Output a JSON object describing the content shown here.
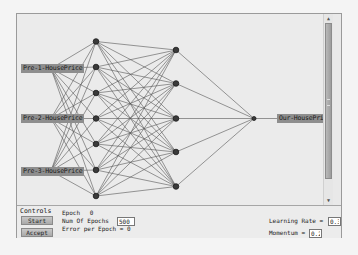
{
  "network": {
    "inputs": [
      {
        "label": "Pre-1-HousePrice",
        "y": 54.5
      },
      {
        "label": "Pre-2-HousePrice",
        "y": 104.5
      },
      {
        "label": "Pre-3-HousePrice",
        "y": 157
      }
    ],
    "hidden1": [
      27.5,
      53,
      79,
      104.5,
      130,
      156,
      182
    ],
    "hidden2": [
      36,
      69.5,
      104.5,
      138,
      172.5
    ],
    "output": {
      "label": "Our-HousePrice",
      "y": 104.5
    },
    "colors": {
      "node_fill": "#3a3a3a",
      "node_stroke": "#1a1a1a",
      "edge": "#555555",
      "label_bg": "#8e8e8e"
    }
  },
  "controls": {
    "title": "Controls",
    "start_label": "Start",
    "accept_label": "Accept",
    "epoch_label": "Epoch",
    "epoch_value": "0",
    "num_epochs_label": "Num Of Epochs",
    "num_epochs_value": "500",
    "error_label": "Error per Epoch = 0",
    "learning_rate_label": "Learning Rate =",
    "learning_rate_value": "0.3",
    "momentum_label": "Momentum =",
    "momentum_value": "0.2"
  },
  "scrollbar": {
    "up_icon": "▲",
    "down_icon": "▼"
  }
}
